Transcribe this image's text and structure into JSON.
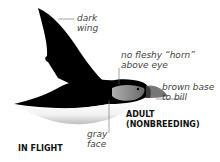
{
  "labels": {
    "wing": [
      "dark",
      "wing"
    ],
    "horn": [
      "no fleshy “horn”",
      "above eye"
    ],
    "bill": [
      "brown base",
      "to bill"
    ],
    "face": [
      "gray",
      "face"
    ]
  },
  "captions": {
    "age": [
      "ADULT",
      "(NONBREEDING)"
    ],
    "pose": "IN FLIGHT"
  },
  "colors": {
    "body": "#000000",
    "belly": "#ffffff",
    "face": "#8a8a8a",
    "bill": "#6e6e6e",
    "leader": "#666666",
    "label": "#444444"
  }
}
